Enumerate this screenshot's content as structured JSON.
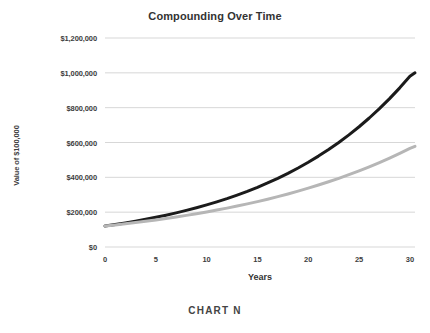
{
  "chart_data": {
    "type": "line",
    "title": "Compounding Over Time",
    "caption": "CHART N",
    "xlabel": "Years",
    "ylabel": "Value of $100,000",
    "xlim": [
      0,
      30.5
    ],
    "ylim": [
      0,
      1200000
    ],
    "grid": "horizontal",
    "legend": "none",
    "x_ticks": [
      0,
      5,
      10,
      15,
      20,
      25,
      30
    ],
    "x_tick_labels": [
      "0",
      "5",
      "10",
      "15",
      "20",
      "25",
      "30"
    ],
    "y_ticks": [
      0,
      200000,
      400000,
      600000,
      800000,
      1000000,
      1200000
    ],
    "y_tick_labels": [
      "$0",
      "$200,000",
      "$400,000",
      "$600,000",
      "$800,000",
      "$1,000,000",
      "$1,200,000"
    ],
    "x": [
      0,
      1,
      2,
      3,
      4,
      5,
      6,
      7,
      8,
      9,
      10,
      11,
      12,
      13,
      14,
      15,
      16,
      17,
      18,
      19,
      20,
      21,
      22,
      23,
      24,
      25,
      26,
      27,
      28,
      29,
      30,
      30.5
    ],
    "series": [
      {
        "name": "Higher return",
        "color": "#1b1b1b",
        "values": [
          120000,
          128700,
          138000,
          148000,
          158800,
          170300,
          182600,
          195900,
          210100,
          225300,
          241600,
          259100,
          277900,
          298100,
          319700,
          342900,
          367800,
          394400,
          423000,
          453700,
          486600,
          521900,
          559700,
          600300,
          643800,
          690500,
          740600,
          794300,
          852000,
          913800,
          980100,
          1000000
        ]
      },
      {
        "name": "Lower return",
        "color": "#b6b6b6",
        "values": [
          120000,
          126400,
          133100,
          140100,
          147600,
          155400,
          163600,
          172300,
          181500,
          191100,
          201300,
          212000,
          223200,
          235100,
          247600,
          260700,
          274600,
          289200,
          304500,
          320700,
          337700,
          355700,
          374600,
          394400,
          415400,
          437400,
          460600,
          485100,
          510800,
          537900,
          566500,
          578000
        ]
      }
    ]
  }
}
